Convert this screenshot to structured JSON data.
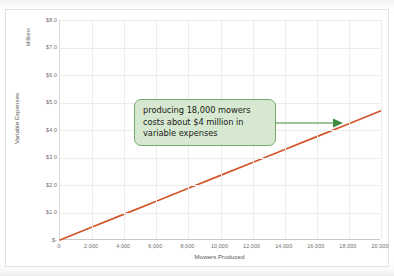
{
  "chart_data": {
    "type": "line",
    "title": "",
    "xlabel": "Mowers Produced",
    "ylabel": "Variable Expenses",
    "y_units_label": "Millions",
    "x": [
      0,
      2000,
      4000,
      6000,
      8000,
      10000,
      12000,
      14000,
      16000,
      18000,
      20000
    ],
    "series": [
      {
        "name": "Variable Expenses",
        "color": "#d2552a",
        "values": [
          0,
          0.47,
          0.94,
          1.41,
          1.88,
          2.35,
          2.82,
          3.29,
          3.76,
          4.23,
          4.7
        ]
      }
    ],
    "xlim": [
      0,
      20000
    ],
    "ylim": [
      0,
      8.0
    ],
    "x_ticks": [
      "0",
      "2,000",
      "4,000",
      "6,000",
      "8,000",
      "10,000",
      "12,000",
      "14,000",
      "16,000",
      "18,000",
      "20,000"
    ],
    "y_ticks": [
      "$-",
      "$1.0",
      "$2.0",
      "$3.0",
      "$4.0",
      "$5.0",
      "$6.0",
      "$7.0",
      "$8.0"
    ],
    "y_tick_values": [
      0,
      1,
      2,
      3,
      4,
      5,
      6,
      7,
      8
    ],
    "grid": true,
    "legend": "none",
    "annotations": [
      {
        "name": "callout-18000-mowers",
        "text": "producing 18,000 mowers costs about $4 million in variable expenses",
        "fill_color": "#d7e8d0",
        "border_color": "#76a86a",
        "arrow_color": "#3f8a3f",
        "points_to_x": 18000,
        "points_to_y": 4.2
      }
    ]
  },
  "annotation": {
    "callout_text": "producing 18,000 mowers costs about $4 million in variable expenses"
  },
  "axes": {
    "x_title": "Mowers Produced",
    "y_title": "Variable Expenses",
    "y_units": "Millions"
  },
  "colors": {
    "line": "#d2552a",
    "grid": "#ececec",
    "callout_fill": "#d7e8d0",
    "callout_border": "#76a86a",
    "arrow": "#3f8a3f",
    "tick_text": "#6d6d6d",
    "axis_title_text": "#555555"
  }
}
